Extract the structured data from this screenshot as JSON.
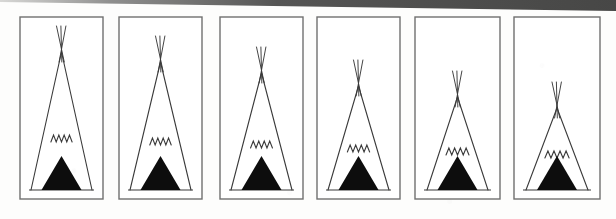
{
  "figure": {
    "panel_count": 6,
    "background_color": "#fdfdfc",
    "ink_color": "#3a3a3a",
    "fill_color": "#0d0d0d",
    "frame_color": "#6f6f6f"
  },
  "page_edge": {
    "name": "scanned-page-edge",
    "color_dark": "#4b4b4b",
    "color_light": "#d8d8d6",
    "left_height": 2,
    "right_height": 11
  },
  "geometry": {
    "frame_top": 17,
    "frame_bottom": 199,
    "frame_stroke": 1.4,
    "ground_inset_left": 9,
    "ground_inset_right": 9,
    "ground_y": 190,
    "pole_overshoot": 26,
    "zigzag_peaks": 4,
    "zigzag_amplitude": 7,
    "door_half_width": 20,
    "door_height": 34
  },
  "panels": [
    {
      "index": 1,
      "label": "panel-1",
      "frame": {
        "x": 20,
        "y": 17,
        "width": 83,
        "height": 182
      },
      "teepee": {
        "apex_x": 61.5,
        "apex_y": 52,
        "base_left_x": 31,
        "base_right_x": 92,
        "base_y": 190,
        "zigzag_y": 142,
        "pole_count": 3,
        "apex_height_px": 138,
        "relative_height": 1.0
      }
    },
    {
      "index": 2,
      "label": "panel-2",
      "frame": {
        "x": 119,
        "y": 17,
        "width": 83,
        "height": 182
      },
      "teepee": {
        "apex_x": 160.5,
        "apex_y": 62,
        "base_left_x": 130,
        "base_right_x": 191,
        "base_y": 190,
        "zigzag_y": 145,
        "pole_count": 3,
        "apex_height_px": 128,
        "relative_height": 0.93
      }
    },
    {
      "index": 3,
      "label": "panel-3",
      "frame": {
        "x": 220,
        "y": 17,
        "width": 83,
        "height": 182
      },
      "teepee": {
        "apex_x": 261.5,
        "apex_y": 73,
        "base_left_x": 231,
        "base_right_x": 292,
        "base_y": 190,
        "zigzag_y": 148,
        "pole_count": 3,
        "apex_height_px": 117,
        "relative_height": 0.85
      }
    },
    {
      "index": 4,
      "label": "panel-4",
      "frame": {
        "x": 317,
        "y": 17,
        "width": 83,
        "height": 182
      },
      "teepee": {
        "apex_x": 358.5,
        "apex_y": 86,
        "base_left_x": 328,
        "base_right_x": 389,
        "base_y": 190,
        "zigzag_y": 152,
        "pole_count": 3,
        "apex_height_px": 104,
        "relative_height": 0.75
      }
    },
    {
      "index": 5,
      "label": "panel-5",
      "frame": {
        "x": 415,
        "y": 17,
        "width": 85,
        "height": 182
      },
      "teepee": {
        "apex_x": 457.5,
        "apex_y": 97,
        "base_left_x": 427,
        "base_right_x": 488,
        "base_y": 190,
        "zigzag_y": 155,
        "pole_count": 3,
        "apex_height_px": 93,
        "relative_height": 0.67
      }
    },
    {
      "index": 6,
      "label": "panel-6",
      "frame": {
        "x": 514,
        "y": 17,
        "width": 86,
        "height": 182
      },
      "teepee": {
        "apex_x": 557,
        "apex_y": 108,
        "base_left_x": 526,
        "base_right_x": 588,
        "base_y": 190,
        "zigzag_y": 158,
        "pole_count": 3,
        "apex_height_px": 82,
        "relative_height": 0.59
      }
    }
  ]
}
